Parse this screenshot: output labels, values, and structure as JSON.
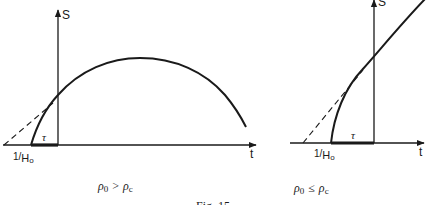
{
  "figure": {
    "caption": "Fig. 15",
    "panels": [
      {
        "id": "left",
        "y_axis_label": "S",
        "x_axis_label": "t",
        "tau_label": "τ",
        "intercept_label_num": "1/",
        "intercept_label_den": "H",
        "intercept_label_sub": "o",
        "condition_lhs": "ρ",
        "condition_lhs_sub": "0",
        "condition_op": ">",
        "condition_rhs": "ρ",
        "condition_rhs_sub": "c",
        "curve_description": "Rises from t-axis, peaks, then falls (recollapse)"
      },
      {
        "id": "right",
        "y_axis_label": "S",
        "x_axis_label": "t",
        "tau_label": "τ",
        "intercept_label_num": "1/",
        "intercept_label_den": "H",
        "intercept_label_sub": "o",
        "condition_lhs": "ρ",
        "condition_lhs_sub": "0",
        "condition_op": "≤",
        "condition_rhs": "ρ",
        "condition_rhs_sub": "c",
        "curve_description": "Rises from t-axis and keeps increasing (ever-expanding)"
      }
    ]
  },
  "colors": {
    "ink": "#1a1a1a",
    "background": "#ffffff"
  }
}
